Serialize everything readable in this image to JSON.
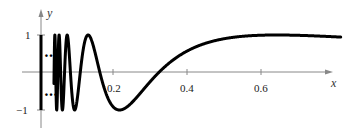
{
  "chart_data": {
    "type": "line",
    "title": "",
    "function": "y = sin(1/x)",
    "xlabel": "x",
    "ylabel": "y",
    "xlim": [
      0,
      0.82
    ],
    "ylim": [
      -1.2,
      1.2
    ],
    "x_ticks": [
      0.2,
      0.4,
      0.6
    ],
    "x_tick_labels": [
      "0.2",
      "0.4",
      "0.6"
    ],
    "y_ticks": [
      1,
      -1
    ],
    "y_tick_labels": [
      "1",
      "−1"
    ],
    "grid": false,
    "legend": null,
    "annotations": [
      "vertical segment at x=0 from -1 to 1 with ellipsis marks (…) indicating infinite oscillation"
    ],
    "series": [
      {
        "name": "sin(1/x)",
        "x": [
          0.05,
          0.1,
          0.15,
          0.2,
          0.22,
          0.25,
          0.3,
          0.35,
          0.4,
          0.5,
          0.6,
          0.7,
          0.8
        ],
        "values": [
          0.91,
          -0.54,
          0.38,
          -0.96,
          -0.98,
          -0.76,
          -0.19,
          0.28,
          0.6,
          0.91,
          0.99,
          0.99,
          0.95
        ]
      }
    ]
  },
  "labels": {
    "x_axis": "x",
    "y_axis": "y",
    "tick_02": "0.2",
    "tick_04": "0.4",
    "tick_06": "0.6",
    "tick_y1": "1",
    "tick_ym1": "−1",
    "dots_upper": "…",
    "dots_lower": "…"
  }
}
